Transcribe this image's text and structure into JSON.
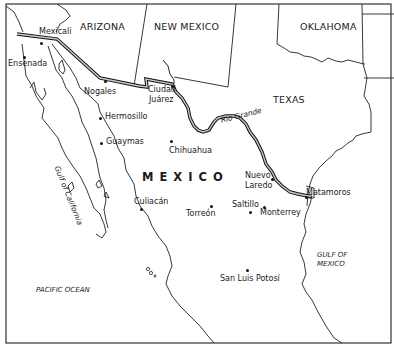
{
  "map": {
    "type": "reference map",
    "region": "U.S.–Mexico border region",
    "country_label": "MEXICO",
    "states": [
      {
        "name": "ARIZONA"
      },
      {
        "name": "NEW MEXICO"
      },
      {
        "name": "OKLAHOMA"
      },
      {
        "name": "TEXAS"
      }
    ],
    "cities": [
      {
        "name": "Mexicali"
      },
      {
        "name": "Ensenada"
      },
      {
        "name": "Nogales"
      },
      {
        "name": "Ciudad Juárez",
        "line1": "Ciudad",
        "line2": "Juárez"
      },
      {
        "name": "Hermosillo"
      },
      {
        "name": "Guaymas"
      },
      {
        "name": "Chihuahua"
      },
      {
        "name": "Culiacán"
      },
      {
        "name": "Torreón"
      },
      {
        "name": "Saltillo"
      },
      {
        "name": "Monterrey"
      },
      {
        "name": "Nuevo Laredo",
        "line1": "Nuevo",
        "line2": "Laredo"
      },
      {
        "name": "Matamoros"
      },
      {
        "name": "San Luis Potosí"
      }
    ],
    "water_bodies": [
      {
        "name": "Gulf of California"
      },
      {
        "name": "PACIFIC OCEAN"
      },
      {
        "name": "GULF OF MEXICO",
        "line1": "GULF OF",
        "line2": "MEXICO"
      }
    ],
    "rivers": [
      {
        "name": "Rio Grande"
      }
    ],
    "colors": {
      "background": "#ffffff",
      "lines": "#1a1a1a",
      "border_fill": "#bbbbbb"
    }
  }
}
